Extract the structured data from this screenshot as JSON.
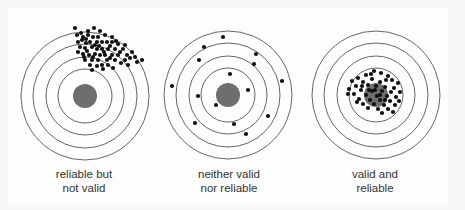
{
  "figure": {
    "colors": {
      "ring": "#555555",
      "bullseye": "#6e6e6e",
      "shot": "#111111",
      "text": "#333333"
    },
    "targets": [
      {
        "id": "reliable-not-valid",
        "label_lines": [
          "reliable but",
          "not valid"
        ],
        "pattern": "tight cluster, off-center (upper right)",
        "shots": [
          [
            75,
            28
          ],
          [
            94,
            28
          ],
          [
            77,
            35
          ],
          [
            83,
            37
          ],
          [
            88,
            35
          ],
          [
            93,
            37
          ],
          [
            98,
            37
          ],
          [
            105,
            35
          ],
          [
            112,
            37
          ],
          [
            78,
            42
          ],
          [
            82,
            40
          ],
          [
            86,
            43
          ],
          [
            90,
            42
          ],
          [
            97,
            42
          ],
          [
            102,
            42
          ],
          [
            107,
            42
          ],
          [
            112,
            42
          ],
          [
            118,
            44
          ],
          [
            125,
            45
          ],
          [
            80,
            47
          ],
          [
            85,
            48
          ],
          [
            92,
            47
          ],
          [
            97,
            49
          ],
          [
            102,
            49
          ],
          [
            108,
            49
          ],
          [
            115,
            49
          ],
          [
            123,
            49
          ],
          [
            132,
            52
          ],
          [
            78,
            52
          ],
          [
            83,
            54
          ],
          [
            89,
            55
          ],
          [
            95,
            54
          ],
          [
            100,
            55
          ],
          [
            105,
            55
          ],
          [
            112,
            55
          ],
          [
            118,
            55
          ],
          [
            127,
            55
          ],
          [
            135,
            57
          ],
          [
            85,
            60
          ],
          [
            92,
            60
          ],
          [
            98,
            60
          ],
          [
            107,
            60
          ],
          [
            115,
            60
          ],
          [
            125,
            60
          ],
          [
            142,
            60
          ],
          [
            90,
            65
          ],
          [
            97,
            66
          ],
          [
            102,
            65
          ],
          [
            108,
            65
          ],
          [
            88,
            31
          ],
          [
            100,
            31
          ],
          [
            86,
            39
          ],
          [
            95,
            45
          ],
          [
            110,
            46
          ],
          [
            120,
            52
          ],
          [
            130,
            58
          ],
          [
            104,
            52
          ],
          [
            87,
            51
          ],
          [
            93,
            57
          ],
          [
            110,
            58
          ],
          [
            121,
            63
          ],
          [
            103,
            69
          ],
          [
            92,
            70
          ],
          [
            113,
            68
          ],
          [
            128,
            65
          ],
          [
            137,
            62
          ],
          [
            81,
            33
          ],
          [
            99,
            46
          ],
          [
            116,
            41
          ],
          [
            84,
            57
          ]
        ]
      },
      {
        "id": "neither",
        "label_lines": [
          "neither valid",
          "nor reliable"
        ],
        "pattern": "scattered widely",
        "shots": [
          [
            223,
            37
          ],
          [
            204,
            47
          ],
          [
            256,
            54
          ],
          [
            199,
            60
          ],
          [
            254,
            64
          ],
          [
            230,
            74
          ],
          [
            172,
            86
          ],
          [
            282,
            81
          ],
          [
            248,
            90
          ],
          [
            198,
            96
          ],
          [
            216,
            105
          ],
          [
            268,
            116
          ],
          [
            195,
            123
          ],
          [
            234,
            124
          ],
          [
            246,
            134
          ]
        ]
      },
      {
        "id": "valid-and-reliable",
        "label_lines": [
          "valid and",
          "reliable"
        ],
        "pattern": "tight cluster on bullseye",
        "shots": [
          [
            374,
            71
          ],
          [
            381,
            73
          ],
          [
            366,
            75
          ],
          [
            388,
            76
          ],
          [
            358,
            78
          ],
          [
            372,
            79
          ],
          [
            392,
            80
          ],
          [
            352,
            81
          ],
          [
            363,
            82
          ],
          [
            380,
            82
          ],
          [
            398,
            83
          ],
          [
            356,
            86
          ],
          [
            368,
            85
          ],
          [
            376,
            86
          ],
          [
            385,
            87
          ],
          [
            394,
            88
          ],
          [
            349,
            89
          ],
          [
            361,
            90
          ],
          [
            372,
            91
          ],
          [
            382,
            91
          ],
          [
            391,
            92
          ],
          [
            400,
            92
          ],
          [
            354,
            94
          ],
          [
            366,
            95
          ],
          [
            377,
            96
          ],
          [
            387,
            96
          ],
          [
            396,
            97
          ],
          [
            359,
            99
          ],
          [
            370,
            100
          ],
          [
            380,
            100
          ],
          [
            390,
            101
          ],
          [
            363,
            104
          ],
          [
            374,
            104
          ],
          [
            384,
            105
          ],
          [
            395,
            105
          ],
          [
            368,
            108
          ],
          [
            378,
            109
          ],
          [
            388,
            109
          ],
          [
            382,
            113
          ],
          [
            393,
            112
          ],
          [
            362,
            86
          ],
          [
            386,
            80
          ],
          [
            371,
            74
          ],
          [
            348,
            94
          ],
          [
            357,
            102
          ],
          [
            399,
            101
          ],
          [
            375,
            90
          ],
          [
            369,
            90
          ],
          [
            380,
            95
          ],
          [
            385,
            100
          ]
        ]
      }
    ]
  }
}
